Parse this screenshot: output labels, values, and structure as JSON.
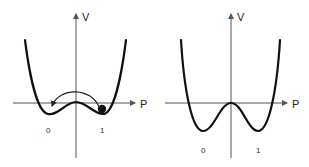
{
  "panels": [
    {
      "id": "left",
      "description": "Asymmetric double-well potential with a particle in well 1 and an arrow showing transition to well 0",
      "axes": {
        "y_label": "V",
        "x_label": "P"
      },
      "minima_labels": [
        "0",
        "1"
      ],
      "particle": "ball-in-well-1",
      "transition_arrow": "from-1-to-0"
    },
    {
      "id": "right",
      "description": "Symmetric double-well potential with deeper wells",
      "axes": {
        "y_label": "V",
        "x_label": "P"
      },
      "minima_labels": [
        "0",
        "1"
      ]
    }
  ],
  "colors": {
    "curve": "#111111",
    "axis": "#555555",
    "background": "#ffffff"
  }
}
